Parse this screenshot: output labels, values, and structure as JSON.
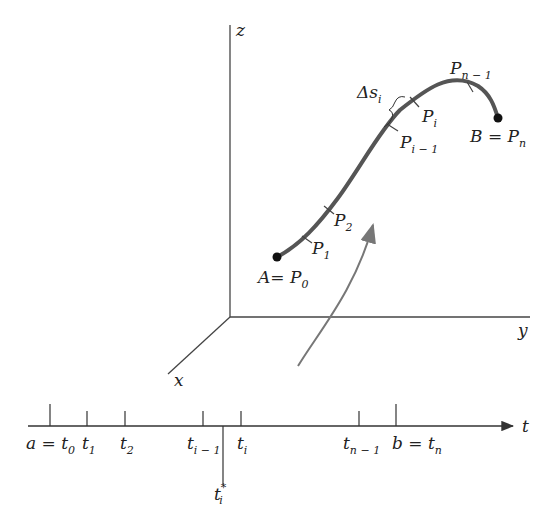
{
  "figure": {
    "type": "arc-length partition of a space curve",
    "axes": {
      "z": "z",
      "y": "y",
      "x": "x"
    },
    "curve_points": [
      {
        "name": "P",
        "sub": "0",
        "prefix": "A= "
      },
      {
        "name": "P",
        "sub": "1"
      },
      {
        "name": "P",
        "sub": "2"
      },
      {
        "name": "P",
        "sub": "i − 1"
      },
      {
        "name": "P",
        "sub": "i"
      },
      {
        "name": "P",
        "sub": "n − 1"
      },
      {
        "name": "P",
        "sub": "n",
        "prefix": "B = "
      }
    ],
    "arc_label": {
      "main": "Δs",
      "sub": "i"
    },
    "parameter_axis": {
      "label": "t",
      "ticks": [
        {
          "prefix": "a = ",
          "main": "t",
          "sub": "0"
        },
        {
          "main": "t",
          "sub": "1"
        },
        {
          "main": "t",
          "sub": "2"
        },
        {
          "main": "t",
          "sub": "i − 1"
        },
        {
          "main": "t",
          "sub": "i"
        },
        {
          "main": "t",
          "sub": "n − 1"
        },
        {
          "prefix": "b = ",
          "main": "t",
          "sub": "n"
        }
      ],
      "sample_point": {
        "main": "t",
        "sub": "i",
        "sup": "*"
      }
    },
    "colors": {
      "curve": "#555555",
      "axes": "#333333",
      "arrow": "#777777",
      "text": "#222222"
    }
  }
}
